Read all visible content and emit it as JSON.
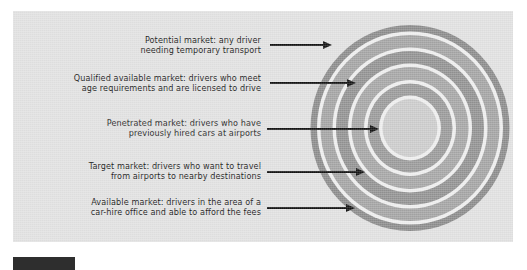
{
  "figure": {
    "type": "concentric-bullseye-market-diagram",
    "background_color": "#e2e2e2",
    "rings": [
      {
        "name": "Potential market",
        "fill": "#8d8d8d",
        "order": 1
      },
      {
        "name": "Qualified available market",
        "fill": "#a5a5a5",
        "order": 2
      },
      {
        "name": "Available market",
        "fill": "#939393",
        "order": 3
      },
      {
        "name": "Target market",
        "fill": "#a7a7a7",
        "order": 4
      },
      {
        "name": "Penetrated market",
        "fill": "#9b9b9b",
        "order": 5
      },
      {
        "name": "core",
        "fill": "#cdcdcd",
        "order": 6
      }
    ],
    "labels": [
      {
        "id": "potential-market",
        "line1": "Potential market: any driver",
        "line2": "needing temporary transport"
      },
      {
        "id": "qualified-available-market",
        "line1": "Qualified available market: drivers who meet",
        "line2": "age requirements and are licensed to drive"
      },
      {
        "id": "penetrated-market",
        "line1": "Penetrated market: drivers who have",
        "line2": "previously hired cars at airports"
      },
      {
        "id": "target-market",
        "line1": "Target market: drivers who want to travel",
        "line2": "from airports to nearby destinations"
      },
      {
        "id": "available-market",
        "line1": "Available market: drivers in the area of a",
        "line2": "car-hire office and able to afford the fees"
      }
    ]
  },
  "caption": {
    "tag": "",
    "text": ""
  }
}
